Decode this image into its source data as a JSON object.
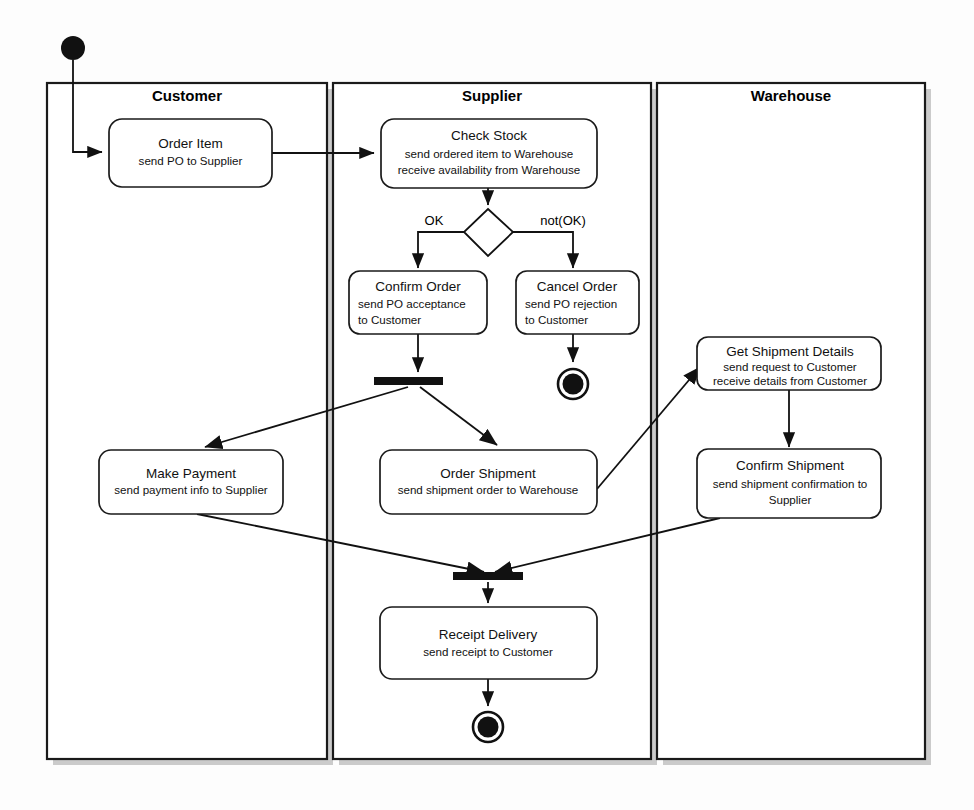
{
  "diagram": {
    "type": "uml-activity-diagram",
    "lanes": [
      {
        "id": "customer",
        "label": "Customer"
      },
      {
        "id": "supplier",
        "label": "Supplier"
      },
      {
        "id": "warehouse",
        "label": "Warehouse"
      }
    ],
    "activities": [
      {
        "id": "order-item",
        "lane": "customer",
        "title": "Order Item",
        "lines": [
          "send PO to Supplier"
        ],
        "align": "center"
      },
      {
        "id": "check-stock",
        "lane": "supplier",
        "title": "Check Stock",
        "lines": [
          "send ordered item to Warehouse",
          "receive availability from Warehouse"
        ],
        "align": "center"
      },
      {
        "id": "confirm-order",
        "lane": "supplier",
        "title": "Confirm Order",
        "lines": [
          "send PO acceptance",
          "to Customer"
        ],
        "align": "left"
      },
      {
        "id": "cancel-order",
        "lane": "supplier",
        "title": "Cancel Order",
        "lines": [
          "send PO rejection",
          "to Customer"
        ],
        "align": "left"
      },
      {
        "id": "get-shipment-details",
        "lane": "warehouse",
        "title": "Get Shipment Details",
        "lines": [
          "send request to Customer",
          "receive details from Customer"
        ],
        "align": "center"
      },
      {
        "id": "confirm-shipment",
        "lane": "warehouse",
        "title": "Confirm Shipment",
        "lines": [
          "send shipment confirmation to",
          "Supplier"
        ],
        "align": "center"
      },
      {
        "id": "make-payment",
        "lane": "customer",
        "title": "Make Payment",
        "lines": [
          "send payment info to Supplier"
        ],
        "align": "center"
      },
      {
        "id": "order-shipment",
        "lane": "supplier",
        "title": "Order Shipment",
        "lines": [
          "send shipment order to Warehouse"
        ],
        "align": "center"
      },
      {
        "id": "receipt-delivery",
        "lane": "supplier",
        "title": "Receipt Delivery",
        "lines": [
          "send receipt to Customer"
        ],
        "align": "center"
      }
    ],
    "decision": {
      "id": "stock-decision",
      "lane": "supplier",
      "guards": [
        {
          "id": "guard-ok",
          "label": "OK",
          "target": "confirm-order"
        },
        {
          "id": "guard-not-ok",
          "label": "not(OK)",
          "target": "cancel-order"
        }
      ]
    },
    "control_nodes": [
      {
        "id": "start-node",
        "kind": "initial",
        "lane": "customer"
      },
      {
        "id": "fork-bar",
        "kind": "fork",
        "lane": "supplier"
      },
      {
        "id": "join-bar",
        "kind": "join",
        "lane": "supplier"
      },
      {
        "id": "end-node-cancel",
        "kind": "final",
        "lane": "supplier"
      },
      {
        "id": "end-node-receipt",
        "kind": "final",
        "lane": "supplier"
      }
    ],
    "transitions": [
      {
        "from": "start-node",
        "to": "order-item"
      },
      {
        "from": "order-item",
        "to": "check-stock"
      },
      {
        "from": "check-stock",
        "to": "stock-decision"
      },
      {
        "from": "stock-decision",
        "to": "confirm-order",
        "guard": "OK"
      },
      {
        "from": "stock-decision",
        "to": "cancel-order",
        "guard": "not(OK)"
      },
      {
        "from": "cancel-order",
        "to": "end-node-cancel"
      },
      {
        "from": "confirm-order",
        "to": "fork-bar"
      },
      {
        "from": "fork-bar",
        "to": "make-payment"
      },
      {
        "from": "fork-bar",
        "to": "order-shipment"
      },
      {
        "from": "order-shipment",
        "to": "get-shipment-details"
      },
      {
        "from": "get-shipment-details",
        "to": "confirm-shipment"
      },
      {
        "from": "make-payment",
        "to": "join-bar"
      },
      {
        "from": "confirm-shipment",
        "to": "join-bar"
      },
      {
        "from": "join-bar",
        "to": "receipt-delivery"
      },
      {
        "from": "receipt-delivery",
        "to": "end-node-receipt"
      }
    ]
  },
  "colors": {
    "line": "#111111",
    "lane_border": "#1a1a1a",
    "lane_fill": "#ffffff",
    "shadow": "#b9b9b9",
    "page_bg": "#fdfdfd"
  }
}
